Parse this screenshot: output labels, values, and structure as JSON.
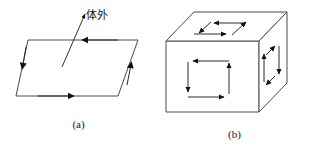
{
  "figure": {
    "background_color": "#ffffff",
    "line_color": "#3a3a3a",
    "arrow_color": "#111111",
    "text_color": "#1a1a1a"
  },
  "panel_a": {
    "caption": "(a)",
    "normal_label": "体外",
    "description": "Parallelogram surface element with boundary circulation arrows and an outward normal vector",
    "edge_arrows": [
      {
        "edge": "top",
        "direction": "left"
      },
      {
        "edge": "left",
        "direction": "down"
      },
      {
        "edge": "bottom",
        "direction": "right"
      },
      {
        "edge": "right",
        "direction": "up"
      }
    ]
  },
  "panel_b": {
    "caption": "(b)",
    "description": "Cube with circulation loops drawn on the top, front and right faces",
    "faces": [
      {
        "name": "top-face",
        "loop_arrows": [
          "left",
          "down-left",
          "right",
          "up-right"
        ]
      },
      {
        "name": "front-face",
        "loop_arrows": [
          "left",
          "down",
          "right",
          "up"
        ]
      },
      {
        "name": "right-face",
        "loop_arrows": [
          "up-right",
          "down",
          "down-left",
          "up"
        ]
      }
    ]
  }
}
